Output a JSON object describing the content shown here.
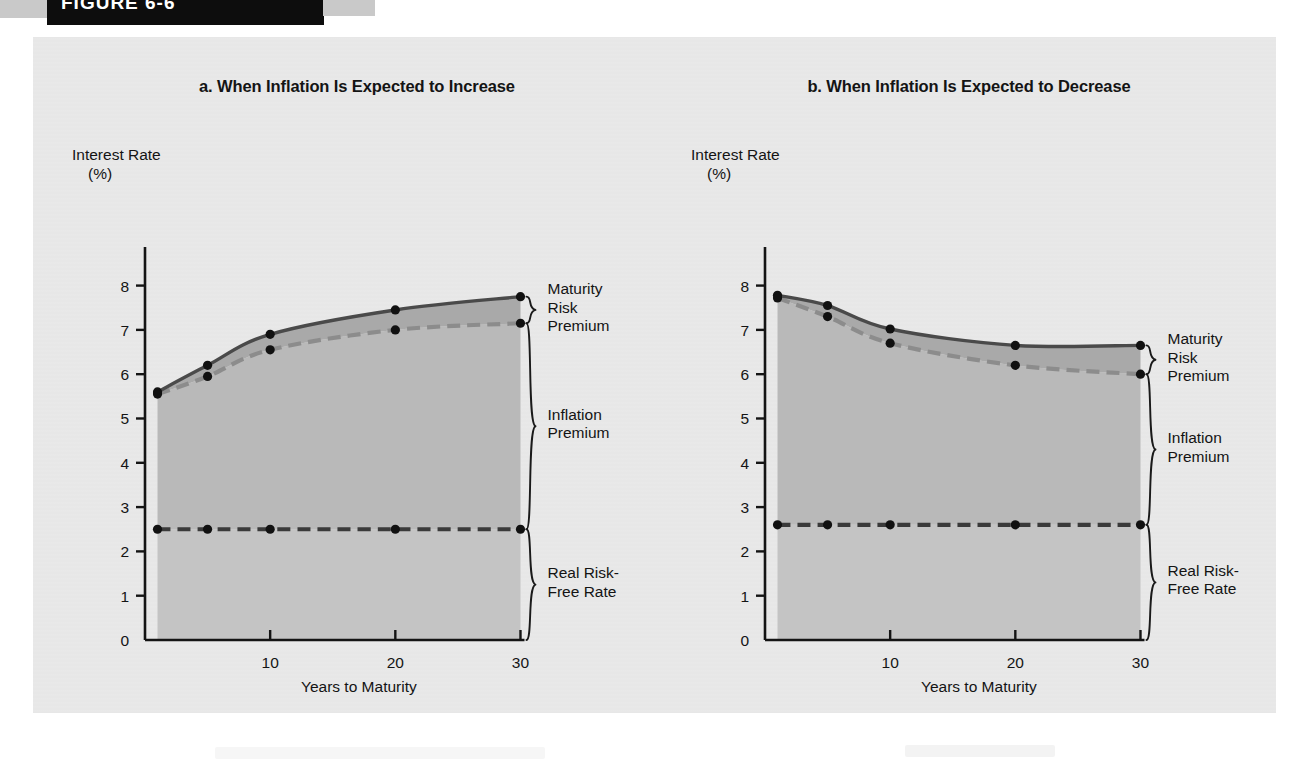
{
  "header": {
    "figure_label": "FIGURE 6-6",
    "bar_color": "#0d0d0d"
  },
  "panel": {
    "background": "#e9e9e9"
  },
  "colors": {
    "solid_line": "#4a4a4a",
    "dashed_line": "#8c8c8c",
    "real_rate_line": "#3a3a3a",
    "band_maturity": "#a9a9a9",
    "band_inflation": "#b9b9b9",
    "band_real": "#c4c4c4",
    "marker": "#111111",
    "axis": "#141414",
    "text": "#141414"
  },
  "charts": [
    {
      "id": "chart-a",
      "title": "a. When Inflation Is Expected to Increase",
      "ylabel_line1": "Interest Rate",
      "ylabel_line2": "(%)",
      "xlabel": "Years to Maturity",
      "yticks": [
        "0",
        "1",
        "2",
        "3",
        "4",
        "5",
        "6",
        "7",
        "8"
      ],
      "xticks": [
        "0",
        "10",
        "20",
        "30"
      ],
      "annotations": [
        {
          "name": "maturity-risk-premium",
          "text": "Maturity\nRisk\nPremium"
        },
        {
          "name": "inflation-premium",
          "text": "Inflation\nPremium"
        },
        {
          "name": "real-risk-free-rate",
          "text": "Real Risk-\nFree Rate"
        }
      ]
    },
    {
      "id": "chart-b",
      "title": "b. When Inflation Is Expected to Decrease",
      "ylabel_line1": "Interest Rate",
      "ylabel_line2": "(%)",
      "xlabel": "Years to Maturity",
      "yticks": [
        "0",
        "1",
        "2",
        "3",
        "4",
        "5",
        "6",
        "7",
        "8"
      ],
      "xticks": [
        "0",
        "10",
        "20",
        "30"
      ],
      "annotations": [
        {
          "name": "maturity-risk-premium",
          "text": "Maturity\nRisk\nPremium"
        },
        {
          "name": "inflation-premium",
          "text": "Inflation\nPremium"
        },
        {
          "name": "real-risk-free-rate",
          "text": "Real Risk-\nFree Rate"
        }
      ]
    }
  ],
  "chart_data": [
    {
      "type": "area",
      "id": "a",
      "title": "a. When Inflation Is Expected to Increase",
      "xlabel": "Years to Maturity",
      "ylabel": "Interest Rate (%)",
      "xlim": [
        0,
        31
      ],
      "ylim": [
        0,
        8.6
      ],
      "xticks": [
        0,
        10,
        20,
        30
      ],
      "yticks": [
        0,
        1,
        2,
        3,
        4,
        5,
        6,
        7,
        8
      ],
      "grid": false,
      "legend": "none",
      "marker_x": [
        1,
        5,
        10,
        20,
        30
      ],
      "series": [
        {
          "name": "Nominal Interest Rate (with maturity risk premium)",
          "style": "solid",
          "color": "#4a4a4a",
          "x": [
            1,
            5,
            10,
            20,
            30
          ],
          "values": [
            5.6,
            6.2,
            6.9,
            7.45,
            7.75
          ]
        },
        {
          "name": "Real Risk-Free Rate + Inflation Premium",
          "style": "dashed",
          "color": "#8c8c8c",
          "x": [
            1,
            5,
            10,
            20,
            30
          ],
          "values": [
            5.55,
            5.95,
            6.55,
            7.0,
            7.15
          ]
        },
        {
          "name": "Real Risk-Free Rate",
          "style": "dashed",
          "color": "#3a3a3a",
          "x": [
            1,
            5,
            10,
            20,
            30
          ],
          "values": [
            2.5,
            2.5,
            2.5,
            2.5,
            2.5
          ]
        }
      ]
    },
    {
      "type": "area",
      "id": "b",
      "title": "b. When Inflation Is Expected to Decrease",
      "xlabel": "Years to Maturity",
      "ylabel": "Interest Rate (%)",
      "xlim": [
        0,
        31
      ],
      "ylim": [
        0,
        8.6
      ],
      "xticks": [
        0,
        10,
        20,
        30
      ],
      "yticks": [
        0,
        1,
        2,
        3,
        4,
        5,
        6,
        7,
        8
      ],
      "grid": false,
      "legend": "none",
      "marker_x": [
        1,
        5,
        10,
        20,
        30
      ],
      "series": [
        {
          "name": "Nominal Interest Rate (with maturity risk premium)",
          "style": "solid",
          "color": "#4a4a4a",
          "x": [
            1,
            5,
            10,
            20,
            30
          ],
          "values": [
            7.78,
            7.55,
            7.02,
            6.65,
            6.65
          ]
        },
        {
          "name": "Real Risk-Free Rate + Inflation Premium",
          "style": "dashed",
          "color": "#8c8c8c",
          "x": [
            1,
            5,
            10,
            20,
            30
          ],
          "values": [
            7.72,
            7.3,
            6.7,
            6.2,
            6.0
          ]
        },
        {
          "name": "Real Risk-Free Rate",
          "style": "dashed",
          "color": "#3a3a3a",
          "x": [
            1,
            5,
            10,
            20,
            30
          ],
          "values": [
            2.6,
            2.6,
            2.6,
            2.6,
            2.6
          ]
        }
      ]
    }
  ]
}
